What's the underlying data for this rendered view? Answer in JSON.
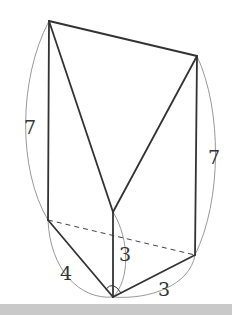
{
  "diagram": {
    "type": "triangular prism with cut (solid geometry)",
    "labels": {
      "left_height": "7",
      "right_height": "7",
      "middle_height": "3",
      "base_left": "4",
      "base_right": "3"
    },
    "right_angle_at": "bottom vertex",
    "colors": {
      "edge": "#333333",
      "arc": "#999999",
      "background": "#ffffff"
    }
  }
}
